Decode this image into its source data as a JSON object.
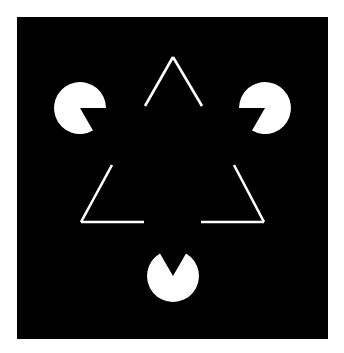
{
  "figure": {
    "name": "Kanizsa triangle illusion",
    "background_color": "#ffffff",
    "panel": {
      "x": 17,
      "y": 17,
      "width": 311,
      "height": 322,
      "color": "#000000"
    },
    "shape_color": "#ffffff",
    "line_width": 2.6,
    "pacmen": [
      {
        "id": "pacman-top-left",
        "cx": 80,
        "cy": 108,
        "r": 26,
        "mouth_start_deg": 0,
        "mouth_end_deg": 60
      },
      {
        "id": "pacman-top-right",
        "cx": 265,
        "cy": 108,
        "r": 26,
        "mouth_start_deg": 120,
        "mouth_end_deg": 180
      },
      {
        "id": "pacman-bottom",
        "cx": 173,
        "cy": 276,
        "r": 26,
        "mouth_start_deg": 240,
        "mouth_end_deg": 300
      }
    ],
    "outline_segments": [
      {
        "id": "apex-left-edge",
        "x1": 145,
        "y1": 106,
        "x2": 173,
        "y2": 57
      },
      {
        "id": "apex-right-edge",
        "x1": 173,
        "y1": 57,
        "x2": 202,
        "y2": 106
      },
      {
        "id": "bottom-left-diagonal",
        "x1": 112,
        "y1": 165,
        "x2": 81,
        "y2": 222
      },
      {
        "id": "bottom-left-base",
        "x1": 81,
        "y1": 222,
        "x2": 144,
        "y2": 222
      },
      {
        "id": "bottom-right-diagonal",
        "x1": 234,
        "y1": 165,
        "x2": 264,
        "y2": 222
      },
      {
        "id": "bottom-right-base",
        "x1": 201,
        "y1": 222,
        "x2": 264,
        "y2": 222
      }
    ]
  }
}
